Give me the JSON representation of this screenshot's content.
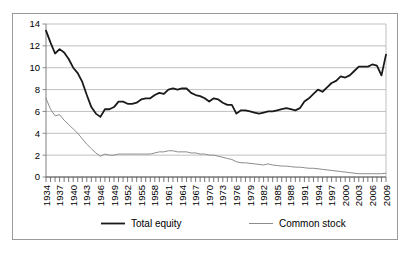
{
  "chart_data": {
    "type": "line",
    "title": "",
    "subtitle": "",
    "xlabel": "",
    "ylabel": "",
    "ylim": [
      0,
      14
    ],
    "yticks": [
      0,
      2,
      4,
      6,
      8,
      10,
      12,
      14
    ],
    "ytick_labels": [
      "0",
      "2",
      "4",
      "6",
      "8",
      "10",
      "12",
      "14"
    ],
    "grid": true,
    "grid_axis": "y",
    "legend_position": "bottom",
    "x_tick_label_rotation": 90,
    "x_tick_label_step": 3,
    "x": [
      1934,
      1935,
      1936,
      1937,
      1938,
      1939,
      1940,
      1941,
      1942,
      1943,
      1944,
      1945,
      1946,
      1947,
      1948,
      1949,
      1950,
      1951,
      1952,
      1953,
      1954,
      1955,
      1956,
      1957,
      1958,
      1959,
      1960,
      1961,
      1962,
      1963,
      1964,
      1965,
      1966,
      1967,
      1968,
      1969,
      1970,
      1971,
      1972,
      1973,
      1974,
      1975,
      1976,
      1977,
      1978,
      1979,
      1980,
      1981,
      1982,
      1983,
      1984,
      1985,
      1986,
      1987,
      1988,
      1989,
      1990,
      1991,
      1992,
      1993,
      1994,
      1995,
      1996,
      1997,
      1998,
      1999,
      2000,
      2001,
      2002,
      2003,
      2004,
      2005,
      2006,
      2007,
      2008,
      2009
    ],
    "xtick_labels": [
      "1934",
      "1937",
      "1940",
      "1943",
      "1946",
      "1949",
      "1952",
      "1955",
      "1958",
      "1961",
      "1964",
      "1967",
      "1970",
      "1973",
      "1976",
      "1979",
      "1982",
      "1985",
      "1988",
      "1991",
      "1994",
      "1997",
      "2000",
      "2003",
      "2006",
      "2009"
    ],
    "series": [
      {
        "name": "Total equity",
        "color": "#1a1a1a",
        "width": 1.8,
        "values": [
          13.4,
          12.3,
          11.3,
          11.7,
          11.4,
          10.8,
          10.0,
          9.5,
          8.7,
          7.5,
          6.4,
          5.8,
          5.5,
          6.2,
          6.2,
          6.4,
          6.9,
          6.9,
          6.7,
          6.7,
          6.8,
          7.1,
          7.2,
          7.2,
          7.5,
          7.7,
          7.6,
          8.0,
          8.1,
          8.0,
          8.1,
          8.1,
          7.7,
          7.5,
          7.4,
          7.2,
          6.9,
          7.2,
          7.1,
          6.8,
          6.6,
          6.6,
          5.8,
          6.1,
          6.1,
          6.0,
          5.9,
          5.8,
          5.9,
          6.0,
          6.0,
          6.1,
          6.2,
          6.3,
          6.2,
          6.1,
          6.3,
          6.9,
          7.2,
          7.6,
          8.0,
          7.8,
          8.2,
          8.6,
          8.8,
          9.2,
          9.1,
          9.3,
          9.7,
          10.1,
          10.1,
          10.1,
          10.3,
          10.2,
          9.3,
          11.2
        ]
      },
      {
        "name": "Common stock",
        "color": "#8c8c8c",
        "width": 1.0,
        "values": [
          7.2,
          6.2,
          5.6,
          5.7,
          5.2,
          4.8,
          4.4,
          4.0,
          3.5,
          3.0,
          2.6,
          2.2,
          1.9,
          2.1,
          2.0,
          2.0,
          2.1,
          2.1,
          2.1,
          2.1,
          2.1,
          2.1,
          2.1,
          2.1,
          2.2,
          2.3,
          2.3,
          2.4,
          2.4,
          2.3,
          2.3,
          2.3,
          2.2,
          2.2,
          2.1,
          2.1,
          2.0,
          2.0,
          1.9,
          1.8,
          1.7,
          1.6,
          1.4,
          1.3,
          1.3,
          1.25,
          1.2,
          1.15,
          1.1,
          1.2,
          1.1,
          1.05,
          1.0,
          1.0,
          0.95,
          0.9,
          0.9,
          0.85,
          0.8,
          0.8,
          0.75,
          0.7,
          0.65,
          0.6,
          0.55,
          0.5,
          0.45,
          0.4,
          0.35,
          0.3,
          0.3,
          0.3,
          0.3,
          0.3,
          0.3,
          0.35
        ]
      }
    ],
    "legend": [
      {
        "label": "Total equity",
        "color": "#1a1a1a",
        "width": 1.8
      },
      {
        "label": "Common stock",
        "color": "#8c8c8c",
        "width": 1.0
      }
    ],
    "colors": {
      "total_equity": "#1a1a1a",
      "common_stock": "#8c8c8c",
      "gridline": "#b0b0b0",
      "axis": "#808080",
      "frame": "#9a9a9a",
      "background": "#ffffff"
    }
  }
}
